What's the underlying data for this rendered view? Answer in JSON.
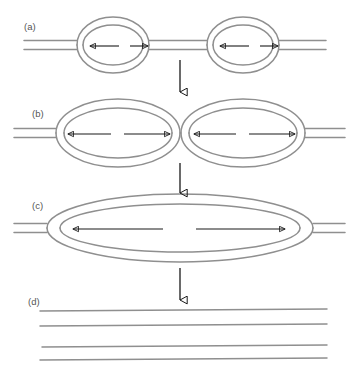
{
  "figure": {
    "background_color": "#ffffff",
    "strand_color": "#8f8f8f",
    "arrow_color": "#1a1a1a",
    "label_color": "#555555",
    "width": 359,
    "height": 373
  },
  "panels": [
    {
      "id": "a",
      "label": "(a)",
      "label_x": 24,
      "label_y": 30,
      "description": "Two small separate replication bubbles on a DNA duplex",
      "axis_y": 45,
      "line_gap": 4.5,
      "strand_left_x": 24,
      "strand_right_x": 326,
      "bubbles": [
        {
          "cx": 113,
          "cy": 45,
          "rx": 36,
          "ry": 28,
          "inner_rx": 30,
          "inner_ry": 20
        },
        {
          "cx": 243,
          "cy": 45,
          "rx": 36,
          "ry": 28,
          "inner_rx": 30,
          "inner_ry": 20
        }
      ],
      "arrows": [
        {
          "x1": 119,
          "y1": 46,
          "x2": 90,
          "y2": 46,
          "direction": "left"
        },
        {
          "x1": 130,
          "y1": 46,
          "x2": 148,
          "y2": 46,
          "direction": "right"
        },
        {
          "x1": 249,
          "y1": 46,
          "x2": 220,
          "y2": 46,
          "direction": "left"
        },
        {
          "x1": 260,
          "y1": 46,
          "x2": 278,
          "y2": 46,
          "direction": "right"
        }
      ]
    },
    {
      "id": "b",
      "label": "(b)",
      "label_x": 32,
      "label_y": 117,
      "description": "Two enlarged replication bubbles that have grown and are about to meet",
      "axis_y": 133,
      "line_gap": 4.5,
      "strand_left_x": 14,
      "strand_right_x": 345,
      "bubbles": [
        {
          "cx": 118,
          "cy": 133,
          "rx": 62,
          "ry": 34,
          "inner_rx": 54,
          "inner_ry": 25
        },
        {
          "cx": 243,
          "cy": 133,
          "rx": 62,
          "ry": 34,
          "inner_rx": 54,
          "inner_ry": 25
        }
      ],
      "arrows": [
        {
          "x1": 111,
          "y1": 134,
          "x2": 68,
          "y2": 134,
          "direction": "left"
        },
        {
          "x1": 124,
          "y1": 134,
          "x2": 170,
          "y2": 134,
          "direction": "right"
        },
        {
          "x1": 236,
          "y1": 134,
          "x2": 194,
          "y2": 134,
          "direction": "left"
        },
        {
          "x1": 249,
          "y1": 134,
          "x2": 295,
          "y2": 134,
          "direction": "right"
        }
      ]
    },
    {
      "id": "c",
      "label": "(c)",
      "label_x": 32,
      "label_y": 209,
      "description": "Bubbles have fused into a single large replication bubble",
      "axis_y": 228,
      "line_gap": 4.5,
      "strand_left_x": 14,
      "strand_right_x": 345,
      "bubbles": [
        {
          "cx": 180,
          "cy": 228,
          "rx": 133,
          "ry": 34,
          "inner_rx": 120,
          "inner_ry": 24
        }
      ],
      "arrows": [
        {
          "x1": 163,
          "y1": 229,
          "x2": 73,
          "y2": 229,
          "direction": "left"
        },
        {
          "x1": 196,
          "y1": 229,
          "x2": 285,
          "y2": 229,
          "direction": "right"
        }
      ]
    },
    {
      "id": "d",
      "label": "(d)",
      "label_x": 28,
      "label_y": 305,
      "description": "Replication complete: two separate daughter DNA duplexes",
      "duplexes": [
        {
          "x1": 40,
          "y1": 311,
          "x2": 327,
          "y2": 309
        },
        {
          "x1": 40,
          "y1": 326,
          "x2": 327,
          "y2": 324
        },
        {
          "x1": 42,
          "y1": 347,
          "x2": 327,
          "y2": 345
        },
        {
          "x1": 40,
          "y1": 360,
          "x2": 327,
          "y2": 358
        }
      ]
    }
  ],
  "flow_arrows": [
    {
      "name": "flow-arrow-a-to-b",
      "x": 180,
      "y1": 60,
      "y2": 92
    },
    {
      "name": "flow-arrow-b-to-c",
      "x": 180,
      "y1": 163,
      "y2": 193
    },
    {
      "name": "flow-arrow-c-to-d",
      "x": 180,
      "y1": 268,
      "y2": 300
    }
  ]
}
